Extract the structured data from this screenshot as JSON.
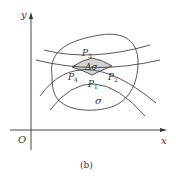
{
  "figure": {
    "caption": "(b)",
    "axes": {
      "x_label": "x",
      "y_label": "y",
      "origin_label": "O"
    },
    "region_label": "σ",
    "cell_label": "Δσ",
    "cell_fill": "#d3d3d3",
    "points": [
      {
        "name": "P",
        "sub": "1"
      },
      {
        "name": "P",
        "sub": "2"
      },
      {
        "name": "P",
        "sub": "3"
      },
      {
        "name": "P",
        "sub": "4"
      }
    ]
  }
}
